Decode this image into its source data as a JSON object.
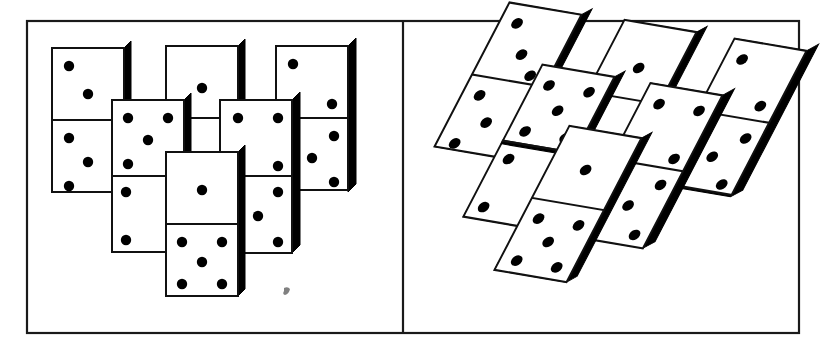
{
  "figure": {
    "kind": "line-drawing",
    "background_color": "#ffffff",
    "ink_color": "#111111",
    "frame": {
      "stroke_color": "#1a1a1a",
      "stroke_width": 2.2,
      "x": 26,
      "y": 20,
      "width": 774,
      "height": 314
    },
    "divider": {
      "x": 403,
      "y_top": 20,
      "y_bottom": 334,
      "stroke_color": "#1a1a1a",
      "stroke_width": 2.2
    },
    "panels": [
      {
        "id": "panel-left",
        "name": "frontal-view-panel",
        "projection": "orthographic",
        "shear_x": 0,
        "shear_y": 0
      },
      {
        "id": "panel-right",
        "name": "oblique-view-panel",
        "projection": "sheared-oblique",
        "shear_x": -0.52,
        "shear_y": 0.17
      }
    ],
    "pip_color": "#000000",
    "pip_radius": 5.2,
    "shadow_depth": 7,
    "smudge": {
      "present": true,
      "x": 285,
      "y": 292,
      "note": "small gray ink smudge on left panel"
    },
    "dominoes": [
      {
        "id": "d1",
        "name": "domino-left-column",
        "top_pips": 2,
        "bottom_pips": 3,
        "x": 52,
        "y": 48,
        "w": 72,
        "h": 144,
        "z": 1
      },
      {
        "id": "d2",
        "name": "domino-upper-middle-left",
        "top_pips": 5,
        "bottom_pips": 2,
        "x": 112,
        "y": 100,
        "w": 72,
        "h": 144,
        "z": 3
      },
      {
        "id": "d3",
        "name": "domino-top-middle",
        "top_pips": 1,
        "bottom_pips": 1,
        "x": 166,
        "y": 46,
        "w": 72,
        "h": 144,
        "z": 2
      },
      {
        "id": "d4",
        "name": "domino-upper-middle-right",
        "top_pips": 4,
        "bottom_pips": 3,
        "x": 220,
        "y": 100,
        "w": 72,
        "h": 144,
        "z": 3
      },
      {
        "id": "d5",
        "name": "domino-right-column",
        "top_pips": 2,
        "bottom_pips": 3,
        "x": 276,
        "y": 46,
        "w": 72,
        "h": 144,
        "z": 2
      },
      {
        "id": "d6",
        "name": "domino-center-front",
        "top_pips": 1,
        "bottom_pips": 5,
        "x": 166,
        "y": 152,
        "w": 72,
        "h": 144,
        "z": 5
      },
      {
        "id": "d7",
        "name": "domino-lower-left",
        "top_pips": 1,
        "bottom_pips": 1,
        "x": 112,
        "y": 176,
        "w": 62,
        "h": 76,
        "z": 2
      }
    ]
  }
}
